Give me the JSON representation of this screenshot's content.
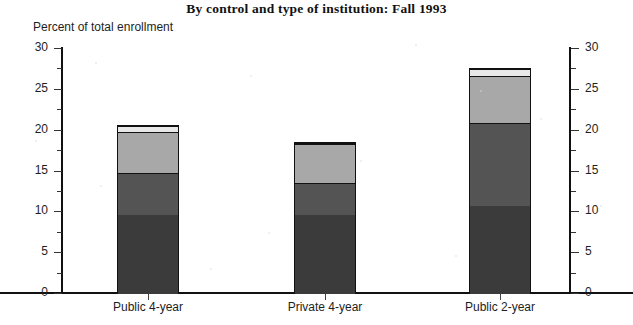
{
  "title": "By control and type of institution:  Fall 1993",
  "axis_caption": "Percent of total enrollment",
  "chart_data": {
    "type": "bar",
    "subtype": "stacked",
    "title": "By control and type of institution:  Fall 1993",
    "subtitle": "",
    "xlabel": "",
    "ylabel": "Percent of total enrollment",
    "ylim": [
      0,
      30
    ],
    "yticks": [
      0,
      5,
      10,
      15,
      20,
      25,
      30
    ],
    "ytick_labels": [
      "0",
      "5",
      "10",
      "15",
      "20",
      "25",
      "30"
    ],
    "yticks_minor": [
      2.5,
      7.5,
      12.5,
      17.5,
      22.5,
      27.5
    ],
    "dual_axis": true,
    "grid": false,
    "legend": "none",
    "categories": [
      "Public 4-year",
      "Private 4-year",
      "Public 2-year"
    ],
    "series": [
      {
        "name": "segment-1",
        "color": "#3b3b3b",
        "values": [
          9.7,
          9.7,
          10.8
        ]
      },
      {
        "name": "segment-2",
        "color": "#545454",
        "values": [
          5.1,
          3.9,
          10.1
        ]
      },
      {
        "name": "segment-3",
        "color": "#a8a8a8",
        "values": [
          5.0,
          4.8,
          5.8
        ]
      },
      {
        "name": "segment-4",
        "color": "#e8e8e8",
        "values": [
          0.8,
          0.1,
          0.8
        ]
      }
    ],
    "totals": [
      20.6,
      18.5,
      27.5
    ]
  },
  "colors": {
    "segment_1": "#3b3b3b",
    "segment_2": "#545454",
    "segment_3": "#a8a8a8",
    "segment_4": "#e8e8e8",
    "axis": "#111111",
    "background": "#ffffff"
  }
}
